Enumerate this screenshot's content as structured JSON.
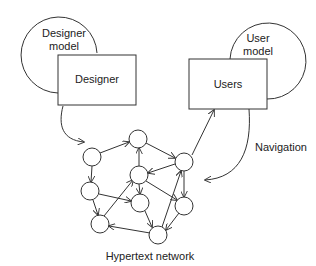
{
  "designer_model": {
    "label_line1": "Designer",
    "label_line2": "model"
  },
  "designer": {
    "label": "Designer"
  },
  "user_model": {
    "label_line1": "User",
    "label_line2": "model"
  },
  "users": {
    "label": "Users"
  },
  "navigation": {
    "label": "Navigation"
  },
  "network": {
    "label": "Hypertext network"
  },
  "colors": {
    "stroke": "#333333",
    "background": "#ffffff"
  }
}
